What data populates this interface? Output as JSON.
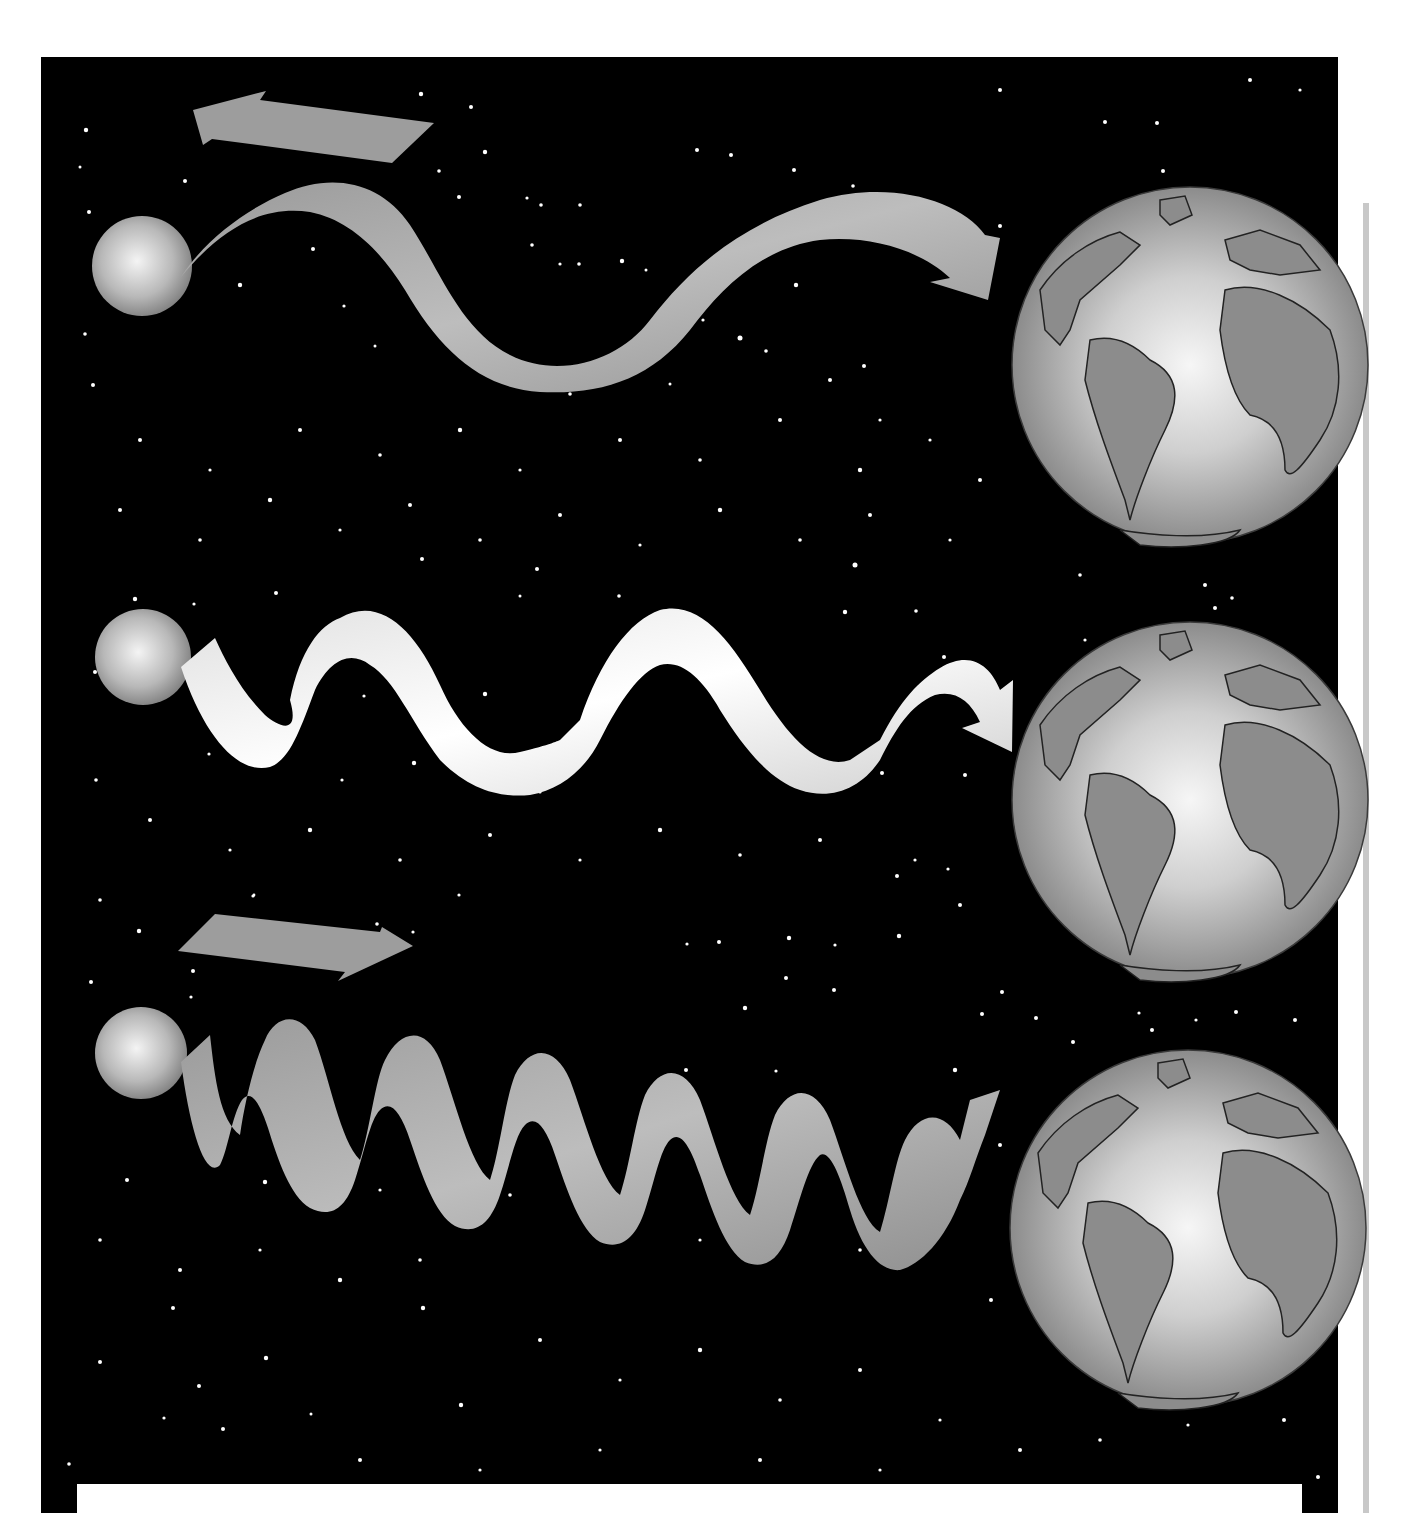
{
  "figure": {
    "colors": {
      "page_background": "#ffffff",
      "space_background": "#000000",
      "star_dots": "#ffffff",
      "ribbon_gray": "#a8a8a8",
      "ribbon_white": "#f2f2f2",
      "globe_ocean_light": "#eeeeee",
      "globe_ocean_dark": "#8a8a8a",
      "globe_land": "#8c8c8c",
      "side_bar": "#c8c8c8"
    },
    "rows": [
      {
        "name": "receding",
        "motion_arrow": "left",
        "wave": "long-wavelength",
        "ribbon_color": "#a8a8a8"
      },
      {
        "name": "stationary",
        "motion_arrow": "none",
        "wave": "medium-wavelength",
        "ribbon_color": "#f2f2f2"
      },
      {
        "name": "approaching",
        "motion_arrow": "right",
        "wave": "short-wavelength",
        "ribbon_color": "#a8a8a8"
      }
    ],
    "caption_box": ""
  }
}
